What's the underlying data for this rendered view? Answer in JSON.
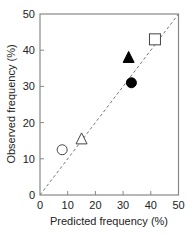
{
  "chart_data": {
    "type": "scatter",
    "title": "",
    "xlabel": "Predicted frequency (%)",
    "ylabel": "Observed frequency (%)",
    "xlim": [
      0,
      50
    ],
    "ylim": [
      0,
      50
    ],
    "xticks": [
      0,
      10,
      20,
      30,
      40,
      50
    ],
    "yticks": [
      0,
      10,
      20,
      30,
      40,
      50
    ],
    "grid": false,
    "legend": null,
    "reference_line": {
      "type": "identity",
      "style": "dashed",
      "color": "#777777",
      "from": [
        0,
        0
      ],
      "to": [
        50,
        50
      ]
    },
    "series": [
      {
        "name": "open-circle",
        "marker": "circle",
        "filled": false,
        "x": 8,
        "y": 12.5
      },
      {
        "name": "open-triangle",
        "marker": "triangle",
        "filled": false,
        "x": 15,
        "y": 15.5
      },
      {
        "name": "filled-triangle",
        "marker": "triangle",
        "filled": true,
        "x": 32,
        "y": 38
      },
      {
        "name": "filled-circle",
        "marker": "circle",
        "filled": true,
        "x": 33,
        "y": 31
      },
      {
        "name": "open-square",
        "marker": "square",
        "filled": false,
        "x": 41.5,
        "y": 43
      }
    ]
  },
  "colors": {
    "axis": "#888888",
    "reference_line": "#777777",
    "marker_stroke": "#444444",
    "marker_fill": "#000000"
  }
}
